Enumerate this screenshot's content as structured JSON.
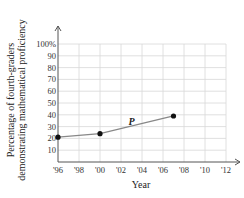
{
  "chart_data": {
    "type": "line",
    "title": "",
    "xlabel": "Year",
    "ylabel": "Percentage of fourth-graders demonstrating mathematical proficiency",
    "ylabel_lines": [
      "Percentage of fourth-graders",
      "demonstrating mathematical proficiency"
    ],
    "x_tick_labels": [
      "'96",
      "'98",
      "'00",
      "'02",
      "'04",
      "'06",
      "'08",
      "'10",
      "'12"
    ],
    "x_ticks": [
      1996,
      1998,
      2000,
      2002,
      2004,
      2006,
      2008,
      2010,
      2012
    ],
    "y_tick_labels": [
      "10",
      "20",
      "30",
      "40",
      "50",
      "60",
      "70",
      "80",
      "90",
      "100%"
    ],
    "y_ticks": [
      10,
      20,
      30,
      40,
      50,
      60,
      70,
      80,
      90,
      100
    ],
    "xlim": [
      1996,
      2013
    ],
    "ylim": [
      0,
      100
    ],
    "grid": true,
    "legend": "none",
    "series": [
      {
        "name": "P",
        "x": [
          1996,
          2000,
          2007
        ],
        "values": [
          21,
          24,
          39
        ]
      }
    ],
    "annotations": [
      {
        "text": "P",
        "x": 2003,
        "y": 31
      }
    ]
  }
}
